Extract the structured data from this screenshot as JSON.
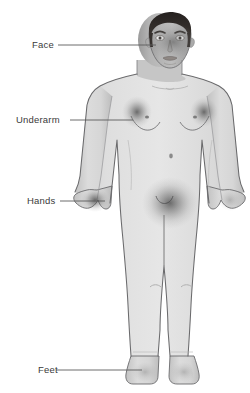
{
  "figure": {
    "background_color": "#ffffff",
    "skin_color": "#d8d8d8",
    "outline_color": "#58585a",
    "hair_color": "#2e2a28",
    "highlight_color": "#4a4a4a",
    "label_color": "#3a3a3a"
  },
  "callouts": [
    {
      "id": "face",
      "label": "Face",
      "label_x": 32,
      "label_y": 40,
      "line_x1": 58,
      "line_x2": 156,
      "line_y": 45
    },
    {
      "id": "underarm",
      "label": "Underarm",
      "label_x": 16,
      "label_y": 115,
      "line_x1": 70,
      "line_x2": 133,
      "line_y": 120
    },
    {
      "id": "hands",
      "label": "Hands",
      "label_x": 27,
      "label_y": 196,
      "line_x1": 60,
      "line_x2": 105,
      "line_y": 201
    },
    {
      "id": "feet",
      "label": "Feet",
      "label_x": 38,
      "label_y": 365,
      "line_x1": 56,
      "line_x2": 142,
      "line_y": 370
    }
  ],
  "highlighted_regions": [
    {
      "id": "face-region",
      "cx": 173,
      "cy": 40,
      "rx": 22,
      "ry": 17,
      "intensity": 0.42
    },
    {
      "id": "underarm-left",
      "cx": 137,
      "cy": 112,
      "rx": 13,
      "ry": 14,
      "intensity": 0.55
    },
    {
      "id": "underarm-right",
      "cx": 204,
      "cy": 112,
      "rx": 13,
      "ry": 14,
      "intensity": 0.5
    },
    {
      "id": "hand-left",
      "cx": 105,
      "cy": 203,
      "rx": 12,
      "ry": 14,
      "intensity": 0.48
    },
    {
      "id": "hand-right",
      "cx": 232,
      "cy": 203,
      "rx": 11,
      "ry": 13,
      "intensity": 0.3
    },
    {
      "id": "groin-region",
      "cx": 170,
      "cy": 203,
      "rx": 26,
      "ry": 24,
      "intensity": 0.62
    },
    {
      "id": "foot-left",
      "cx": 153,
      "cy": 373,
      "rx": 12,
      "ry": 9,
      "intensity": 0.25
    },
    {
      "id": "foot-right",
      "cx": 188,
      "cy": 373,
      "rx": 12,
      "ry": 9,
      "intensity": 0.22
    }
  ],
  "body_details": [
    {
      "id": "nipple-left",
      "cx": 147,
      "cy": 117
    },
    {
      "id": "nipple-right",
      "cx": 195,
      "cy": 117
    },
    {
      "id": "navel",
      "cx": 171,
      "cy": 156
    },
    {
      "id": "knee-left",
      "cx": 155,
      "cy": 287
    },
    {
      "id": "knee-right",
      "cx": 186,
      "cy": 287
    },
    {
      "id": "collarbone",
      "cx": 170,
      "cy": 88
    }
  ]
}
